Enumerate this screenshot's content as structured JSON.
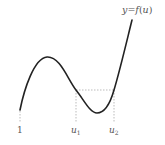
{
  "figure": {
    "curve_label": "y = f(u)",
    "x_labels": [
      {
        "text": "1",
        "x": 20
      },
      {
        "text": "u",
        "sub": "1",
        "x": 76
      },
      {
        "text": "u",
        "sub": "2",
        "x": 114
      }
    ],
    "colors": {
      "curve": "#222222",
      "dashed": "#bbbbbb",
      "text": "#555555"
    }
  }
}
